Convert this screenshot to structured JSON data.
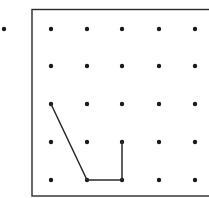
{
  "diagram": {
    "type": "dot-grid-geoboard",
    "grid": {
      "rows": 5,
      "cols": 5,
      "col_x": [
        51,
        87,
        122,
        159,
        195
      ],
      "row_y": [
        29,
        66,
        104,
        142,
        180
      ],
      "dot_radius": 2.2,
      "dot_color": "#1a1a1a"
    },
    "frame": {
      "x": 32,
      "y": 9.5,
      "width": 190,
      "height": 186.5,
      "stroke": "#2a2a2a",
      "stroke_width": 1.4
    },
    "stray_dot": {
      "x": 4,
      "y": 29
    },
    "path": {
      "description": "Polyline connecting grid points",
      "points_grid": [
        [
          0,
          2
        ],
        [
          1,
          4
        ],
        [
          2,
          4
        ],
        [
          2,
          3
        ]
      ],
      "stroke": "#2a2a2a",
      "stroke_width": 1.5
    }
  }
}
